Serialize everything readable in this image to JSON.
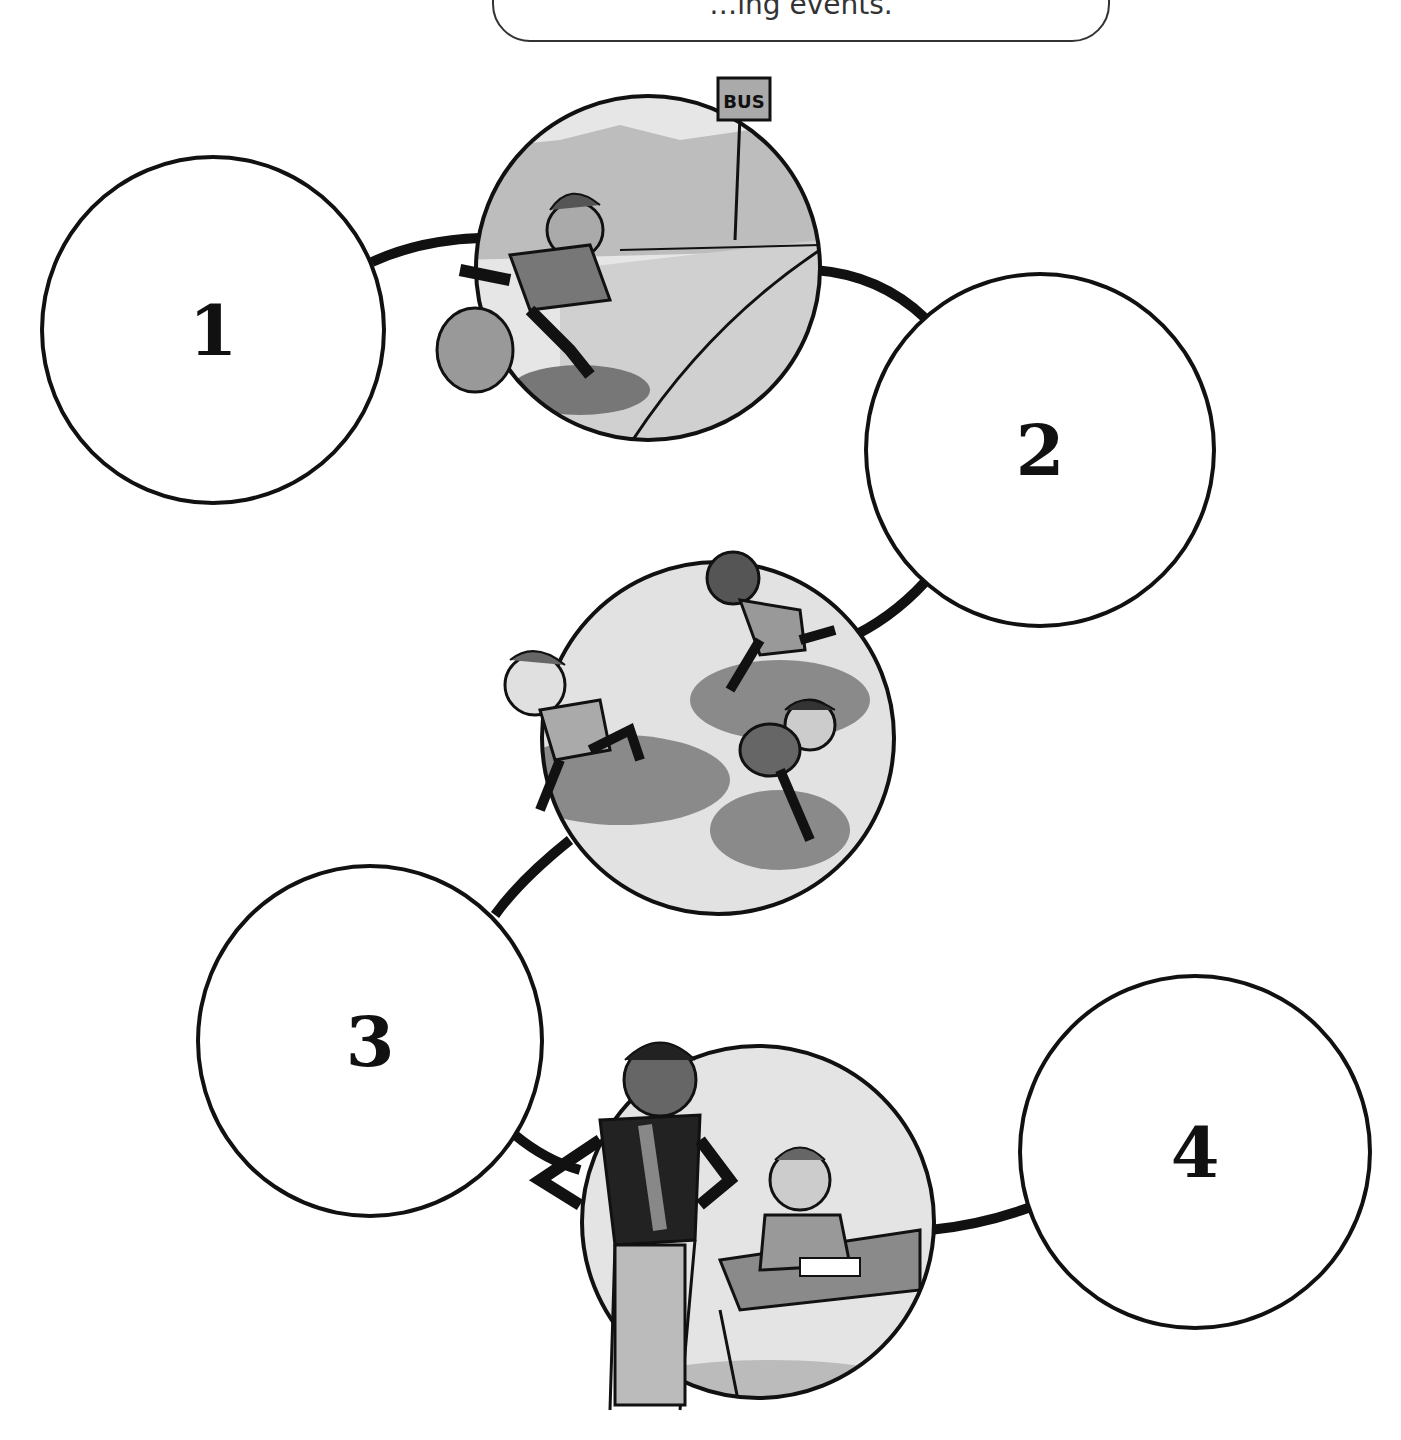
{
  "instruction": {
    "text": "…ing events."
  },
  "sequence_circles": [
    {
      "label": "1"
    },
    {
      "label": "2"
    },
    {
      "label": "3"
    },
    {
      "label": "4"
    }
  ],
  "pictures": [
    {
      "name": "boy-running-to-bus-stop",
      "sign_text": "BUS"
    },
    {
      "name": "children-running"
    },
    {
      "name": "teacher-and-student-at-desk"
    }
  ],
  "colors": {
    "ink": "#111111",
    "light_gray": "#d8d8d8",
    "mid_gray": "#9a9a9a",
    "dark_gray": "#555555"
  }
}
